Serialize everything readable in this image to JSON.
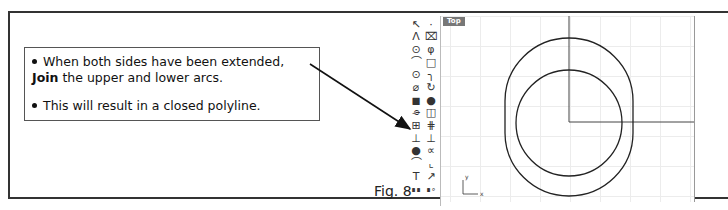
{
  "callout": {
    "bullets": [
      {
        "text_before": "When both sides have been extended, ",
        "bold": "Join",
        "text_after": " the upper and lower arcs."
      },
      {
        "text": "This will result in a closed polyline."
      }
    ]
  },
  "figure": {
    "label": "Fig. 8"
  },
  "viewport": {
    "name": "Top",
    "axis_labels": {
      "y": "y",
      "x": "x"
    }
  },
  "toolbar": {
    "icons": [
      "select-arrow-icon",
      "point-icon",
      "polyline-icon",
      "curve-control-points-icon",
      "circle-icon",
      "circle-center-icon",
      "arc-icon",
      "rectangle-icon",
      "ellipse-icon",
      "fillet-icon",
      "surface-icon",
      "revolve-icon",
      "solid-box-icon",
      "solid-sphere-icon",
      "cylinder-icon",
      "extrude-icon",
      "join-icon",
      "explode-icon",
      "boolean-union-icon",
      "boolean-split-icon",
      "group-icon",
      "ungroup-icon",
      "offset-icon",
      "trim-icon",
      "text-icon",
      "dimension-icon",
      "layout-icon",
      "render-icon"
    ]
  },
  "colors": {
    "frame": "#333333",
    "viewport_label_bg": "#777777",
    "grid": "#ececec",
    "geometry": "#222222"
  }
}
